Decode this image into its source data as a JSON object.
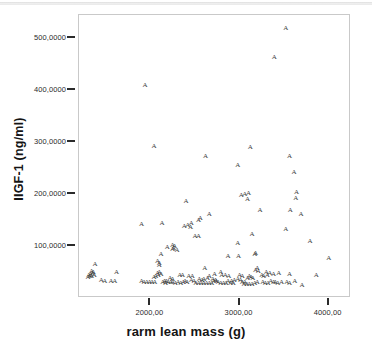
{
  "chart_data": {
    "type": "scatter",
    "title": "",
    "xlabel": "rarm lean mass (g)",
    "ylabel": "IIGF-1 (ng/ml)",
    "xlim": [
      1200,
      4250
    ],
    "ylim": [
      0,
      545
    ],
    "grid": false,
    "legend": null,
    "marker_glyph": "A",
    "marker_color": "#3d3d3d",
    "frame_color": "#c9c9c9",
    "xticks": [
      {
        "value": 2000,
        "label": "2000,00"
      },
      {
        "value": 3000,
        "label": "3000,00"
      },
      {
        "value": 4000,
        "label": "4000,00"
      }
    ],
    "yticks": [
      {
        "value": 100,
        "label": "100,0000"
      },
      {
        "value": 200,
        "label": "200,0000"
      },
      {
        "value": 300,
        "label": "300,0000"
      },
      {
        "value": 400,
        "label": "400,0000"
      },
      {
        "value": 500,
        "label": "500,0000"
      }
    ],
    "n_points": 160,
    "points": [
      [
        3520,
        520
      ],
      [
        3390,
        465
      ],
      [
        1940,
        410
      ],
      [
        2040,
        293
      ],
      [
        3120,
        290
      ],
      [
        2620,
        274
      ],
      [
        3560,
        274
      ],
      [
        2980,
        256
      ],
      [
        3610,
        243
      ],
      [
        3640,
        204
      ],
      [
        3100,
        203
      ],
      [
        3060,
        200
      ],
      [
        3020,
        199
      ],
      [
        3630,
        192
      ],
      [
        3090,
        190
      ],
      [
        2400,
        187
      ],
      [
        3230,
        170
      ],
      [
        3570,
        169
      ],
      [
        3690,
        162
      ],
      [
        2660,
        161
      ],
      [
        2560,
        155
      ],
      [
        2540,
        150
      ],
      [
        2460,
        144
      ],
      [
        2130,
        145
      ],
      [
        1900,
        142
      ],
      [
        2420,
        140
      ],
      [
        2380,
        139
      ],
      [
        2450,
        137
      ],
      [
        3520,
        133
      ],
      [
        3140,
        123
      ],
      [
        2540,
        120
      ],
      [
        2500,
        119
      ],
      [
        3790,
        110
      ],
      [
        2980,
        106
      ],
      [
        2250,
        103
      ],
      [
        2270,
        100
      ],
      [
        2190,
        98
      ],
      [
        2260,
        96
      ],
      [
        2250,
        94
      ],
      [
        2300,
        92
      ],
      [
        3180,
        86
      ],
      [
        3170,
        84
      ],
      [
        2870,
        81
      ],
      [
        2990,
        80
      ],
      [
        4000,
        78
      ],
      [
        2120,
        84
      ],
      [
        1380,
        66
      ],
      [
        2080,
        72
      ],
      [
        2100,
        68
      ],
      [
        2100,
        64
      ],
      [
        2610,
        58
      ],
      [
        3200,
        57
      ],
      [
        3180,
        54
      ],
      [
        3210,
        52
      ],
      [
        1340,
        52
      ],
      [
        1360,
        50
      ],
      [
        1620,
        51
      ],
      [
        1350,
        48
      ],
      [
        2100,
        50
      ],
      [
        2080,
        48
      ],
      [
        2120,
        46
      ],
      [
        3300,
        50
      ],
      [
        3340,
        48
      ],
      [
        3380,
        46
      ],
      [
        3440,
        48
      ],
      [
        3560,
        47
      ],
      [
        3860,
        44
      ],
      [
        3310,
        44
      ],
      [
        2790,
        50
      ],
      [
        2720,
        46
      ],
      [
        2800,
        44
      ],
      [
        2840,
        44
      ],
      [
        2660,
        43
      ],
      [
        2880,
        42
      ],
      [
        2330,
        45
      ],
      [
        2360,
        44
      ],
      [
        2430,
        43
      ],
      [
        2470,
        42
      ],
      [
        1340,
        42
      ],
      [
        1300,
        40
      ],
      [
        2640,
        38
      ],
      [
        2600,
        37
      ],
      [
        3110,
        42
      ],
      [
        3130,
        40
      ],
      [
        3090,
        38
      ],
      [
        3150,
        38
      ],
      [
        2980,
        36
      ],
      [
        3010,
        35
      ],
      [
        2940,
        34
      ],
      [
        1450,
        34
      ],
      [
        1490,
        33
      ],
      [
        1560,
        33
      ],
      [
        1600,
        32
      ],
      [
        1900,
        32
      ],
      [
        1930,
        31
      ],
      [
        1960,
        31
      ],
      [
        1990,
        30
      ],
      [
        2020,
        30
      ],
      [
        2050,
        31
      ],
      [
        2200,
        31
      ],
      [
        2230,
        30
      ],
      [
        2250,
        30
      ],
      [
        2280,
        29
      ],
      [
        2310,
        30
      ],
      [
        2340,
        29
      ],
      [
        2370,
        30
      ],
      [
        2510,
        29
      ],
      [
        2540,
        29
      ],
      [
        2570,
        28
      ],
      [
        2600,
        29
      ],
      [
        2630,
        28
      ],
      [
        2660,
        29
      ],
      [
        2690,
        28
      ],
      [
        2760,
        30
      ],
      [
        2790,
        29
      ],
      [
        2820,
        29
      ],
      [
        2850,
        28
      ],
      [
        2900,
        28
      ],
      [
        2930,
        29
      ],
      [
        3050,
        27
      ],
      [
        3080,
        27
      ],
      [
        3110,
        27
      ],
      [
        3140,
        27
      ],
      [
        3260,
        30
      ],
      [
        3290,
        29
      ],
      [
        3320,
        28
      ],
      [
        3400,
        30
      ],
      [
        3430,
        29
      ],
      [
        3470,
        30
      ],
      [
        3620,
        32
      ],
      [
        3700,
        25
      ],
      [
        1310,
        45
      ],
      [
        1330,
        47
      ],
      [
        1320,
        43
      ],
      [
        1370,
        44
      ],
      [
        2040,
        40
      ],
      [
        2060,
        42
      ],
      [
        2090,
        44
      ],
      [
        2220,
        38
      ],
      [
        2250,
        37
      ],
      [
        2460,
        34
      ],
      [
        2490,
        33
      ],
      [
        2710,
        33
      ],
      [
        2740,
        32
      ],
      [
        2870,
        33
      ],
      [
        2910,
        32
      ],
      [
        3030,
        31
      ],
      [
        3060,
        30
      ],
      [
        3170,
        29
      ],
      [
        3200,
        31
      ],
      [
        3350,
        32
      ],
      [
        3380,
        31
      ],
      [
        3530,
        30
      ],
      [
        3560,
        29
      ],
      [
        2160,
        33
      ],
      [
        2180,
        32
      ],
      [
        2390,
        32
      ],
      [
        2410,
        31
      ],
      [
        2550,
        36
      ],
      [
        2580,
        35
      ],
      [
        2700,
        36
      ],
      [
        2730,
        35
      ],
      [
        3000,
        45
      ],
      [
        3030,
        43
      ],
      [
        3250,
        44
      ],
      [
        3270,
        42
      ],
      [
        2140,
        30
      ],
      [
        2170,
        29
      ]
    ]
  }
}
